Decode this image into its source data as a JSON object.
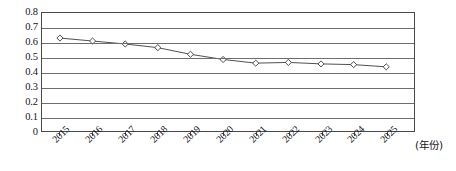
{
  "chart_data": {
    "type": "line",
    "title": "",
    "xlabel": "(年份)",
    "ylabel": "",
    "categories": [
      "2015",
      "2016",
      "2017",
      "2018",
      "2019",
      "2020",
      "2021",
      "2022",
      "2023",
      "2024",
      "2025"
    ],
    "values": [
      0.63,
      0.61,
      0.59,
      0.565,
      0.52,
      0.485,
      0.46,
      0.465,
      0.455,
      0.45,
      0.435
    ],
    "series": [
      {
        "name": "",
        "values": [
          0.63,
          0.61,
          0.59,
          0.565,
          0.52,
          0.485,
          0.46,
          0.465,
          0.455,
          0.45,
          0.435
        ]
      }
    ],
    "ylim": [
      0,
      0.8
    ],
    "ytick_labels": [
      "0.8",
      "0.7",
      "0.6",
      "0.5",
      "0.4",
      "0.3",
      "0.2",
      "0.1",
      "0"
    ],
    "ytick_values": [
      0.8,
      0.7,
      0.6,
      0.5,
      0.4,
      0.3,
      0.2,
      0.1,
      0
    ],
    "grid": true,
    "grid_axis": "y",
    "legend": false,
    "legend_position": "none",
    "marker": "diamond-open",
    "line_color": "#3a3a3a",
    "marker_color": "#3a3a3a",
    "marker_fill": "#ffffff",
    "grid_color": "#6e6e72",
    "frame_color": "#4a4a4a",
    "background": "#ffffff"
  }
}
